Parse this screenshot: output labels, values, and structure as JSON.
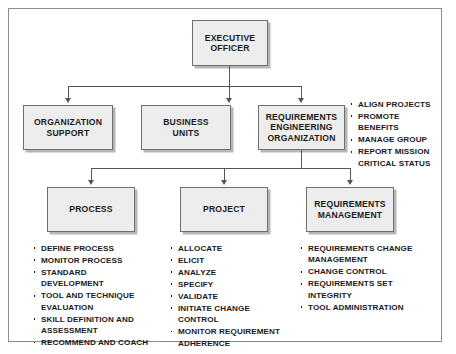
{
  "diagram": {
    "colors": {
      "box_fill": "#ededed",
      "box_border": "#6f6f6f",
      "box_shadow": "#b6b6b6",
      "connector": "#555555",
      "text": "#1a1a1a",
      "frame_border": "#8d8d8d",
      "page_background": "#ffffff"
    },
    "nodes": {
      "executive_officer": "EXECUTIVE\nOFFICER",
      "organization_support": "ORGANIZATION\nSUPPORT",
      "business_units": "BUSINESS\nUNITS",
      "requirements_engineering_organization": "REQUIREMENTS\nENGINEERING\nORGANIZATION",
      "process": "PROCESS",
      "project": "PROJECT",
      "requirements_management": "REQUIREMENTS\nMANAGEMENT"
    },
    "bullet_lists": {
      "requirements_engineering_organization": [
        "ALIGN PROJECTS",
        "PROMOTE BENEFITS",
        "MANAGE GROUP",
        "REPORT MISSION CRITICAL STATUS"
      ],
      "process": [
        "DEFINE PROCESS",
        "MONITOR PROCESS",
        "STANDARD DEVELOPMENT",
        "TOOL AND TECHNIQUE EVALUATION",
        "SKILL DEFINITION AND ASSESSMENT",
        "RECOMMEND AND COACH"
      ],
      "project": [
        "ALLOCATE",
        "ELICIT",
        "ANALYZE",
        "SPECIFY",
        "VALIDATE",
        "INITIATE CHANGE CONTROL",
        "MONITOR REQUIREMENT ADHERENCE"
      ],
      "requirements_management": [
        "REQUIREMENTS CHANGE MANAGEMENT",
        "CHANGE CONTROL",
        "REQUIREMENTS SET INTEGRITY",
        "TOOL ADMINISTRATION"
      ]
    }
  }
}
